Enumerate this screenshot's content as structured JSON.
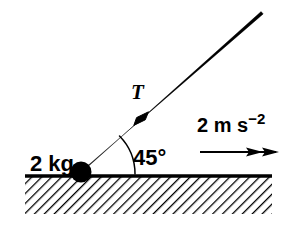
{
  "diagram": {
    "type": "free-body-force-diagram",
    "background_color": "#ffffff",
    "ink_color": "#000000",
    "mass_label": {
      "text": "2 kg",
      "value": 2,
      "unit": "kg",
      "x": 30,
      "y": 171
    },
    "tension_label": {
      "text": "T",
      "symbol": "T",
      "meaning": "tension",
      "x": 131,
      "y": 99
    },
    "angle_label": {
      "text": "45°",
      "value": 45,
      "unit": "degrees",
      "x": 133,
      "y": 165
    },
    "acceleration_label": {
      "text": "2 m s",
      "exponent": "−2",
      "full_text": "2 m s−2",
      "value": 2,
      "unit": "m s^-2",
      "x": 197,
      "y": 132
    },
    "particle": {
      "name": "particle",
      "cx": 81,
      "cy": 172,
      "r": 10.5,
      "fill": "#000000"
    },
    "ground": {
      "name": "ground-surface",
      "x1": 25,
      "y1": 176,
      "x2": 272,
      "y2": 176,
      "thickness": 3.4,
      "hatch_angle_deg": 45,
      "hatch_spacing": 7,
      "hatch_depth": 37
    },
    "string": {
      "name": "string",
      "x1": 81,
      "y1": 172,
      "x2": 262,
      "y2": 13,
      "angle_deg": 45,
      "base_thickness": 5.4,
      "tip_thickness": 1.2,
      "arrow_at": {
        "x": 141,
        "y": 119
      },
      "arrow_size": 9
    },
    "angle_arc": {
      "name": "angle-arc",
      "cx": 81,
      "cy": 174,
      "radius": 54,
      "start_deg": 0,
      "end_deg": 45,
      "thickness": 1.4
    },
    "acceleration_arrow": {
      "name": "acceleration-arrow",
      "x1": 200,
      "y1": 152,
      "x2": 279,
      "y2": 152,
      "thickness": 1.8,
      "heads": 2,
      "head_length": 16,
      "head_width": 7
    }
  }
}
